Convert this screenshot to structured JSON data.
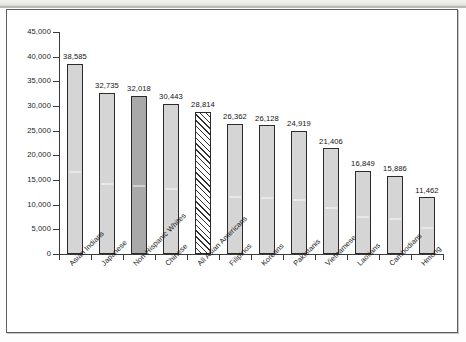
{
  "figure": {
    "background_color": "#ffffff",
    "frame_color": "#5d5d5d"
  },
  "chart_data": {
    "type": "bar",
    "title": "",
    "subtitle": "",
    "xlabel": "",
    "ylabel": "",
    "ylim": [
      0,
      45000
    ],
    "ytick_step": 5000,
    "grid": false,
    "legend": null,
    "orientation": "vertical",
    "sorted": "descending",
    "categories": [
      "Asian Indians",
      "Japanese",
      "Non-Hispanic Whites",
      "Chinese",
      "All Asian Americans",
      "Filipinos",
      "Koreans",
      "Pakistanis",
      "Vietnamese",
      "Laotians",
      "Cambodians",
      "Hmong"
    ],
    "values": [
      38585,
      32735,
      32018,
      30443,
      28814,
      26362,
      26128,
      24919,
      21406,
      16849,
      15886,
      11462
    ],
    "value_labels": [
      "38,585",
      "32,735",
      "32,018",
      "30,443",
      "28,814",
      "26,362",
      "26,128",
      "24,919",
      "21,406",
      "16,849",
      "15,886",
      "11,462"
    ],
    "bar_styles": [
      "light",
      "light",
      "dark",
      "light",
      "hatched",
      "light",
      "light",
      "light",
      "light",
      "light",
      "light",
      "light"
    ],
    "style_colors": {
      "light": "#d5d5d5",
      "dark": "#a9a9a9",
      "hatched": "#ffffff",
      "outline": "#2b2b2b"
    },
    "ytick_labels": [
      "0",
      "5,000",
      "10,000",
      "15,000",
      "20,000",
      "25,000",
      "30,000",
      "35,000",
      "40,000",
      "45,000"
    ],
    "ytick_values": [
      0,
      5000,
      10000,
      15000,
      20000,
      25000,
      30000,
      35000,
      40000,
      45000
    ]
  }
}
